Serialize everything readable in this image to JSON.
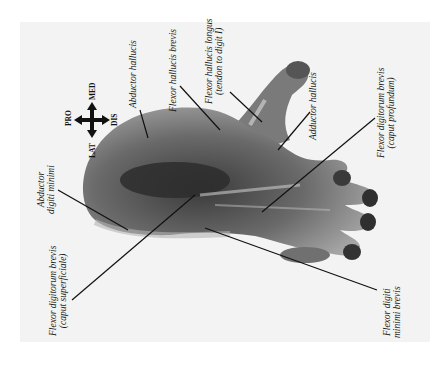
{
  "figure": {
    "background_color": "#f3f3f3",
    "orientation_indicator": {
      "up": "PRO",
      "down": "DIS",
      "left": "LAT",
      "right": "MED",
      "icon": "four-way-arrow-icon"
    },
    "labels": [
      {
        "id": "abductor-hallucis-1",
        "lines": [
          "Abductor hallucis"
        ]
      },
      {
        "id": "flexor-hallucis-brevis",
        "lines": [
          "Flexor hallucis brevis"
        ]
      },
      {
        "id": "flexor-hallucis-longus",
        "lines": [
          "Flexor hallucis longus",
          "(tendon to digit I)"
        ]
      },
      {
        "id": "adductor-hallucis",
        "lines": [
          "Adductor hallucis"
        ]
      },
      {
        "id": "flexor-digitorum-brevis-profundum",
        "lines": [
          "Flexor digitorum brevis",
          "(caput profundum)"
        ]
      },
      {
        "id": "abductor-digiti-minimi",
        "lines": [
          "Abductor",
          "digiti minimi"
        ]
      },
      {
        "id": "flexor-digitorum-brevis-superficiale",
        "lines": [
          "Flexor digitorum brevis",
          "(caput superficiale)"
        ]
      },
      {
        "id": "flexor-digiti-minimi-brevis",
        "lines": [
          "Flexor digiti",
          "minimi brevis"
        ]
      }
    ]
  }
}
